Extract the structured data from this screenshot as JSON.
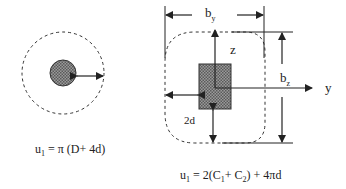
{
  "left_diagram": {
    "title": "circular-column-perimeter",
    "formula": {
      "lhs": "u",
      "lhs_sub": "1",
      "rhs": " = π (D+ 4d)"
    }
  },
  "right_diagram": {
    "title": "rectangular-column-perimeter",
    "labels": {
      "by": "b",
      "by_sub": "y",
      "bz": "b",
      "bz_sub": "z",
      "z_axis": "z",
      "y_axis": "y",
      "offset": "2d"
    },
    "formula": {
      "lhs": "u",
      "lhs_sub": "1",
      "part1": " = 2(C",
      "c1_sub": "1",
      "part2": "+ C",
      "c2_sub": "2",
      "part3": ") + 4πd"
    }
  },
  "colors": {
    "line": "#222222",
    "fill": "#888888",
    "background": "#ffffff"
  }
}
